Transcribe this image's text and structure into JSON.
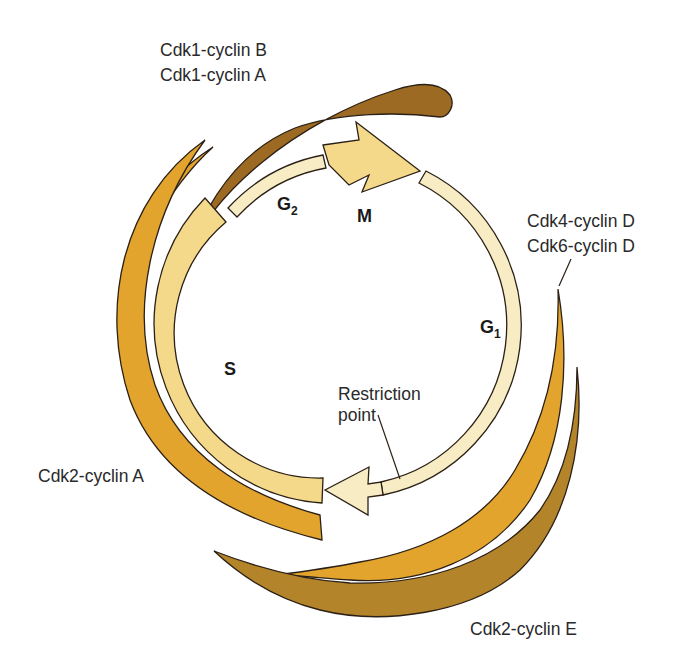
{
  "diagram": {
    "type": "cell-cycle",
    "phases": {
      "g1": {
        "letter": "G",
        "sub": "1"
      },
      "s": {
        "letter": "S"
      },
      "g2": {
        "letter": "G",
        "sub": "2"
      },
      "m": {
        "letter": "M"
      }
    },
    "restriction_point": {
      "line1": "Restriction",
      "line2": "point"
    },
    "complexes": {
      "cdk1": {
        "line1": "Cdk1-cyclin B",
        "line2": "Cdk1-cyclin A"
      },
      "cdk46": {
        "line1": "Cdk4-cyclin D",
        "line2": "Cdk6-cyclin D"
      },
      "cdk2a": {
        "label": "Cdk2-cyclin A"
      },
      "cdk2e": {
        "label": "Cdk2-cyclin E"
      }
    },
    "colors": {
      "thin_ring": "#f8ecc4",
      "s_and_m": "#f5d98a",
      "cyclin_a_band": "#e3a42e",
      "cyclin_d_band": "#e3a42e",
      "cyclin_e_band": "#b3842a",
      "cdk1_band": "#9c6a22",
      "outline": "#2b2016",
      "text": "#2a2a2a"
    }
  }
}
